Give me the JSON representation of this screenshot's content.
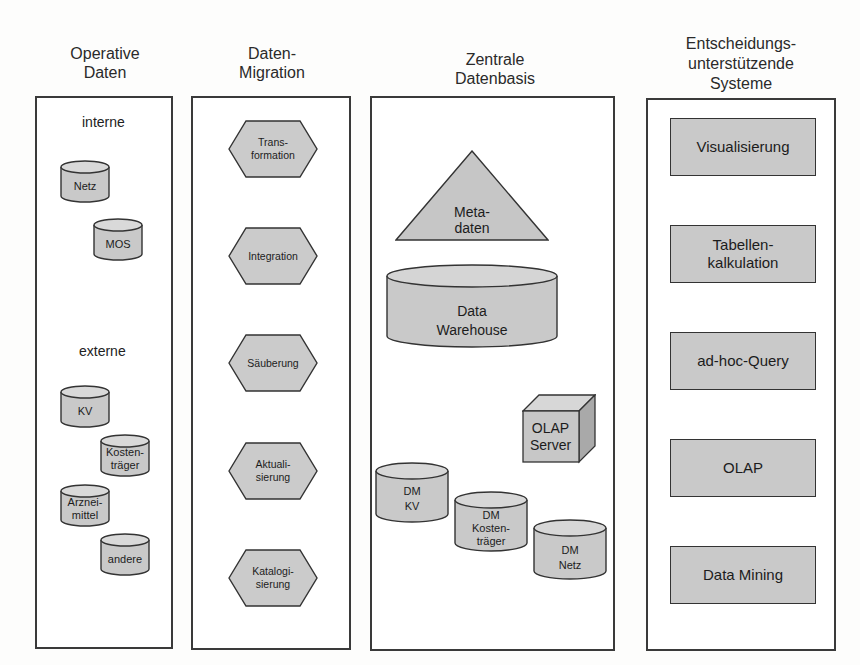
{
  "columns": [
    {
      "title": "Operative\nDaten"
    },
    {
      "title": "Daten-\nMigration"
    },
    {
      "title": "Zentrale\nDatenbasis"
    },
    {
      "title": "Entscheidungs-\nunterstützende\nSysteme"
    }
  ],
  "operative": {
    "internal_label": "interne",
    "external_label": "externe",
    "internal_sources": [
      "Netz",
      "MOS"
    ],
    "external_sources": [
      "KV",
      "Kosten-\nträger",
      "Arznei-\nmittel",
      "andere"
    ]
  },
  "migration": {
    "steps": [
      "Trans-\nformation",
      "Integration",
      "Säuberung",
      "Aktuali-\nsierung",
      "Katalogi-\nsierung"
    ]
  },
  "central": {
    "metadata": "Meta-\ndaten",
    "warehouse": "Data\nWarehouse",
    "olap_server": "OLAP\nServer",
    "data_marts": [
      "DM\nKV",
      "DM\nKosten-\nträger",
      "DM\nNetz"
    ]
  },
  "decision_support": {
    "systems": [
      "Visualisierung",
      "Tabellen-\nkalkulation",
      "ad-hoc-Query",
      "OLAP",
      "Data Mining"
    ]
  },
  "colors": {
    "shape_fill": "#c9c9c9",
    "shape_top": "#d9d9d9",
    "stroke": "#333333"
  }
}
